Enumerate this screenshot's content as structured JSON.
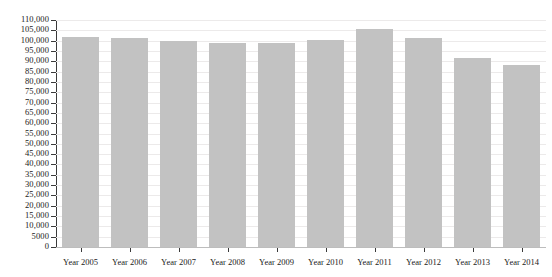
{
  "chart_data": {
    "type": "bar",
    "title": "",
    "subtitle": "",
    "xlabel": "",
    "ylabel": "",
    "categories": [
      "Year 2005",
      "Year 2006",
      "Year 2007",
      "Year 2008",
      "Year 2009",
      "Year 2010",
      "Year 2011",
      "Year 2012",
      "Year 2013",
      "Year 2014"
    ],
    "values": [
      102000,
      101500,
      100000,
      99000,
      98700,
      100500,
      105800,
      101500,
      91500,
      88000
    ],
    "ylim": [
      0,
      110000
    ],
    "ytick_values": [
      0,
      5000,
      10000,
      15000,
      20000,
      25000,
      30000,
      35000,
      40000,
      45000,
      50000,
      55000,
      60000,
      65000,
      70000,
      75000,
      80000,
      85000,
      90000,
      95000,
      100000,
      105000,
      110000
    ],
    "ytick_labels": [
      "0",
      "5000",
      "10,000",
      "15,000",
      "20,000",
      "25,000",
      "30,000",
      "35,000",
      "40,000",
      "45,000",
      "50,000",
      "55,000",
      "60,000",
      "65,000",
      "70,000",
      "75,000",
      "80,000",
      "85,000",
      "90,000",
      "95,000",
      "100,000",
      "105,000",
      "110,000"
    ],
    "grid": true,
    "legend": false,
    "legend_position": "none",
    "bar_color": "#c2c2c2",
    "axis_color": "#3a3a3a",
    "grid_color": "#eceaea",
    "background_color": "#ffffff"
  }
}
